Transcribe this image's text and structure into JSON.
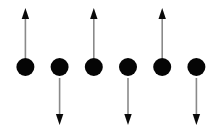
{
  "figure": {
    "type": "spin-chain-diagram",
    "canvas": {
      "width": 222,
      "height": 139,
      "background": "#ffffff"
    },
    "colors": {
      "node_fill": "#050505",
      "arrow_head_fill": "#0a0a0a",
      "arrow_shaft_stroke": "#8a8a8a",
      "background": "#ffffff"
    },
    "geometry": {
      "node_radius": 9,
      "node_center_y": 67,
      "node_spacing": 34.2,
      "first_node_center_x": 25.4,
      "shaft_width": 1.6,
      "head_width": 7.4,
      "head_height": 11,
      "up_arrow_tip_y": 8,
      "up_arrow_tail_y": 58,
      "down_arrow_tip_y": 125,
      "down_arrow_tail_y": 78
    },
    "nodes": [
      {
        "index": 1,
        "cx": 25.4,
        "cy": 67,
        "r": 9,
        "arrow": "up",
        "label": "node-1"
      },
      {
        "index": 2,
        "cx": 59.6,
        "cy": 67,
        "r": 9,
        "arrow": "down",
        "label": "node-2"
      },
      {
        "index": 3,
        "cx": 93.8,
        "cy": 67,
        "r": 9,
        "arrow": "up",
        "label": "node-3"
      },
      {
        "index": 4,
        "cx": 128.0,
        "cy": 67,
        "r": 9,
        "arrow": "down",
        "label": "node-4"
      },
      {
        "index": 5,
        "cx": 162.2,
        "cy": 67,
        "r": 9,
        "arrow": "up",
        "label": "node-5"
      },
      {
        "index": 6,
        "cx": 196.4,
        "cy": 67,
        "r": 9,
        "arrow": "down",
        "label": "node-6"
      }
    ]
  }
}
